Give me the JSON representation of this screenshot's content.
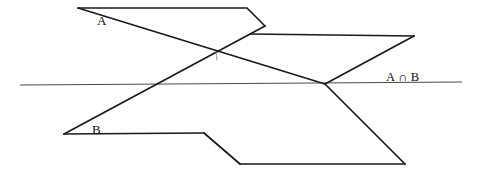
{
  "figure": {
    "width": 480,
    "height": 178,
    "background_color": "#ffffff"
  },
  "labels": {
    "plane_a": "A",
    "plane_b": "B",
    "intersection": "A ∩ B"
  },
  "colors": {
    "edge_stroke": "#1a1a1a",
    "intersection_stroke": "#4a4a4a",
    "tick_stroke": "#8a8a99",
    "text": "#0d0d0d"
  },
  "geometry": {
    "plane_a_path": "M 78,8 L 247,8 L 265,26",
    "plane_a_lower_path": "M 250,34 L 414,36",
    "plane_a_left_edge": "M 78,8 L 325,84",
    "plane_a_right_edge": "M 414,36 L 325,84",
    "plane_b_top_path": "M 64,134 L 204,133",
    "plane_b_bottom_path": "M 240,164 L 405,164",
    "plane_b_left_edge": "M 64,134 L 265,26",
    "plane_b_right_edge": "M 405,164 L 325,84",
    "plane_b_lower_left_edge": "M 204,133 L 240,164",
    "intersection_path": "M 20,85 L 462,82",
    "crossing_point": [
      157,
      83
    ],
    "right_vertex": [
      325,
      84
    ],
    "tick_mark_path": "M 216,52 L 217,60"
  }
}
